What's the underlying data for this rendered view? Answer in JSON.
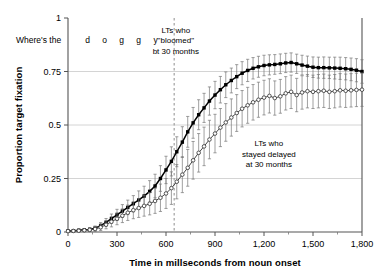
{
  "figure": {
    "name": "proportion-target-fixation-over-time"
  },
  "chart_data": {
    "type": "line",
    "title": "",
    "xlabel": "Time in millseconds from noun onset",
    "ylabel": "Proportion target fixation",
    "xlim": [
      0,
      1800
    ],
    "ylim": [
      0,
      1
    ],
    "xticks": [
      0,
      300,
      600,
      900,
      1200,
      1500,
      1800
    ],
    "xtick_labels": [
      "0",
      "300",
      "600",
      "900",
      "1,200",
      "1,500",
      "1,800"
    ],
    "yticks": [
      0,
      0.25,
      0.5,
      0.75,
      1
    ],
    "ytick_labels": [
      "0",
      "0.25",
      "0.5",
      "0.75",
      "1"
    ],
    "grid": "horizontal",
    "legend_position": "inline-annotations",
    "x": [
      0,
      33,
      66,
      100,
      133,
      166,
      200,
      233,
      266,
      300,
      333,
      366,
      400,
      433,
      466,
      500,
      533,
      566,
      600,
      633,
      666,
      700,
      733,
      766,
      800,
      833,
      866,
      900,
      933,
      966,
      1000,
      1033,
      1066,
      1100,
      1133,
      1166,
      1200,
      1233,
      1266,
      1300,
      1333,
      1366,
      1400,
      1433,
      1466,
      1500,
      1533,
      1566,
      1600,
      1633,
      1666,
      1700,
      1733,
      1766,
      1800
    ],
    "series": [
      {
        "name": "LTs who \"bloomed\" bt 30 months",
        "marker": "filled-square",
        "color": "#000000",
        "values": [
          0.005,
          0.006,
          0.008,
          0.01,
          0.012,
          0.018,
          0.03,
          0.045,
          0.062,
          0.08,
          0.098,
          0.115,
          0.132,
          0.15,
          0.168,
          0.19,
          0.215,
          0.25,
          0.29,
          0.33,
          0.375,
          0.42,
          0.468,
          0.51,
          0.548,
          0.58,
          0.612,
          0.64,
          0.665,
          0.688,
          0.708,
          0.726,
          0.742,
          0.755,
          0.765,
          0.772,
          0.778,
          0.781,
          0.783,
          0.786,
          0.79,
          0.792,
          0.786,
          0.78,
          0.775,
          0.77,
          0.768,
          0.768,
          0.767,
          0.766,
          0.765,
          0.763,
          0.76,
          0.756,
          0.75
        ],
        "errors": [
          0.004,
          0.004,
          0.005,
          0.006,
          0.008,
          0.01,
          0.014,
          0.018,
          0.022,
          0.026,
          0.03,
          0.034,
          0.038,
          0.042,
          0.046,
          0.05,
          0.055,
          0.06,
          0.064,
          0.068,
          0.07,
          0.072,
          0.072,
          0.072,
          0.07,
          0.068,
          0.066,
          0.064,
          0.062,
          0.06,
          0.058,
          0.056,
          0.054,
          0.052,
          0.05,
          0.049,
          0.048,
          0.047,
          0.046,
          0.046,
          0.045,
          0.045,
          0.045,
          0.046,
          0.047,
          0.048,
          0.049,
          0.05,
          0.05,
          0.051,
          0.052,
          0.052,
          0.053,
          0.054,
          0.055
        ]
      },
      {
        "name": "LTs who stayed delayed at 30 months",
        "marker": "open-circle",
        "color": "#444444",
        "values": [
          0.004,
          0.005,
          0.006,
          0.008,
          0.01,
          0.014,
          0.022,
          0.034,
          0.048,
          0.062,
          0.076,
          0.09,
          0.102,
          0.112,
          0.122,
          0.132,
          0.145,
          0.16,
          0.18,
          0.205,
          0.235,
          0.268,
          0.3,
          0.335,
          0.37,
          0.4,
          0.432,
          0.46,
          0.488,
          0.512,
          0.535,
          0.556,
          0.576,
          0.592,
          0.606,
          0.618,
          0.628,
          0.636,
          0.626,
          0.634,
          0.648,
          0.655,
          0.64,
          0.652,
          0.658,
          0.655,
          0.658,
          0.66,
          0.655,
          0.658,
          0.662,
          0.66,
          0.662,
          0.664,
          0.665
        ],
        "errors": [
          0.004,
          0.004,
          0.005,
          0.006,
          0.008,
          0.011,
          0.015,
          0.019,
          0.024,
          0.028,
          0.032,
          0.036,
          0.04,
          0.044,
          0.048,
          0.052,
          0.058,
          0.064,
          0.07,
          0.076,
          0.08,
          0.084,
          0.086,
          0.088,
          0.09,
          0.09,
          0.09,
          0.09,
          0.089,
          0.088,
          0.087,
          0.086,
          0.085,
          0.084,
          0.083,
          0.082,
          0.081,
          0.08,
          0.08,
          0.079,
          0.078,
          0.078,
          0.078,
          0.078,
          0.078,
          0.078,
          0.078,
          0.078,
          0.078,
          0.078,
          0.078,
          0.078,
          0.078,
          0.078,
          0.078
        ]
      }
    ],
    "vertical_marker": {
      "x": 650,
      "style": "dashed",
      "color": "#999999"
    },
    "annotations": [
      {
        "name": "bloomed-group-label",
        "lines": [
          "LTs who",
          "\"bloomed\"",
          "bt 30 months"
        ],
        "x": 660,
        "y": 0.93
      },
      {
        "name": "delayed-group-label",
        "lines": [
          "LTs who",
          "stayed delayed",
          "at 30 months"
        ],
        "x": 1230,
        "y": 0.4
      },
      {
        "name": "carrier-phrase",
        "text": "Where's the",
        "x": -180,
        "y": 0.885
      },
      {
        "name": "target-word",
        "letters": [
          "d",
          "o",
          "g",
          "g",
          "y"
        ],
        "x": 120,
        "y": 0.885
      }
    ]
  }
}
